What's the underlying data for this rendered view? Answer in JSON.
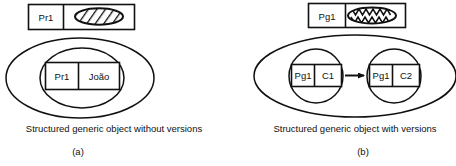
{
  "figure": {
    "panels": [
      {
        "id": "a",
        "panel_label": "(a)",
        "caption": "Structured generic object without versions",
        "header_box": {
          "left_label": "Pr1",
          "right_glyph": "hatched-ellipse-icon"
        },
        "inner_box": {
          "left_label": "Pr1",
          "right_label": "João"
        }
      },
      {
        "id": "b",
        "panel_label": "(b)",
        "caption": "Structured generic object with versions",
        "header_box": {
          "left_label": "Pg1",
          "right_glyph": "scribble-ellipse-icon"
        },
        "version_boxes": [
          {
            "left_label": "Pg1",
            "right_label": "C1"
          },
          {
            "left_label": "Pg1",
            "right_label": "C2"
          }
        ],
        "arrow": "version-arrow-icon"
      }
    ]
  },
  "colors": {
    "stroke": "#111111",
    "background": "#ffffff",
    "text": "#111111"
  }
}
